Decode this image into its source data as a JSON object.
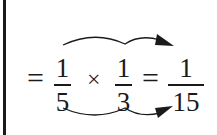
{
  "equation": {
    "eq1": "=",
    "frac1": {
      "numerator": "1",
      "denominator": "5"
    },
    "operator": "×",
    "frac2": {
      "numerator": "1",
      "denominator": "3"
    },
    "eq2": "=",
    "result": {
      "numerator": "1",
      "denominator": "15"
    }
  },
  "annotations": {
    "top_arrow": "numerators multiplied",
    "bottom_arrow": "denominators multiplied"
  },
  "colors": {
    "ink": "#1a1a1a",
    "background": "#ffffff"
  }
}
